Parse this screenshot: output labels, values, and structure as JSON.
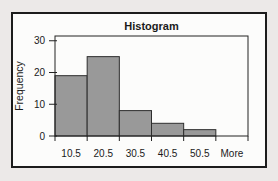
{
  "chart_data": {
    "type": "bar",
    "title": "Histogram",
    "xlabel": "",
    "ylabel": "Frequency",
    "categories": [
      "10.5",
      "20.5",
      "30.5",
      "40.5",
      "50.5",
      "More"
    ],
    "values": [
      19,
      25,
      8,
      4,
      2,
      0
    ],
    "yticks": [
      0,
      10,
      20,
      30
    ],
    "ylim": [
      0,
      31.5
    ],
    "grid": false,
    "legend": false,
    "bar_gap": 0
  },
  "colors": {
    "page_bg": "#ece9e8",
    "box_bg": "#fcfcfb",
    "frame": "#1c1c1c",
    "axis": "#222222",
    "bar_fill": "#999999",
    "bar_stroke": "#2e2e2e",
    "text": "#1a1a1a"
  }
}
